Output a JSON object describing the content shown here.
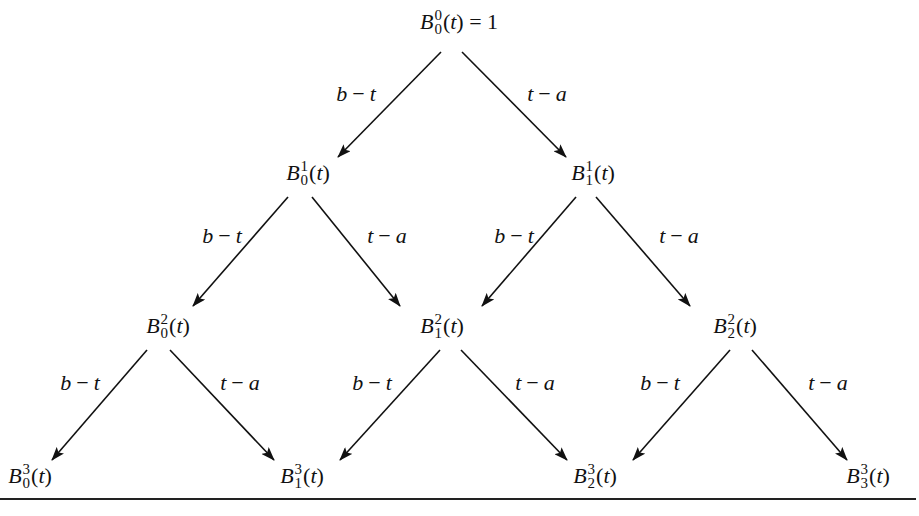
{
  "diagram": {
    "edge_labels": {
      "left": "b − t",
      "right": "t − a"
    },
    "nodes": [
      {
        "id": "B00",
        "base": "B",
        "sup": "0",
        "sub": "0",
        "arg": "(t)",
        "tail": " = 1",
        "x": 459,
        "y": 22
      },
      {
        "id": "B10",
        "base": "B",
        "sup": "1",
        "sub": "0",
        "arg": "(t)",
        "tail": "",
        "x": 308,
        "y": 173
      },
      {
        "id": "B11",
        "base": "B",
        "sup": "1",
        "sub": "1",
        "arg": "(t)",
        "tail": "",
        "x": 593,
        "y": 173
      },
      {
        "id": "B20",
        "base": "B",
        "sup": "2",
        "sub": "0",
        "arg": "(t)",
        "tail": "",
        "x": 168,
        "y": 326
      },
      {
        "id": "B21",
        "base": "B",
        "sup": "2",
        "sub": "1",
        "arg": "(t)",
        "tail": "",
        "x": 442,
        "y": 326
      },
      {
        "id": "B22",
        "base": "B",
        "sup": "2",
        "sub": "2",
        "arg": "(t)",
        "tail": "",
        "x": 735,
        "y": 326
      },
      {
        "id": "B30",
        "base": "B",
        "sup": "3",
        "sub": "0",
        "arg": "(t)",
        "tail": "",
        "x": 30,
        "y": 476
      },
      {
        "id": "B31",
        "base": "B",
        "sup": "3",
        "sub": "1",
        "arg": "(t)",
        "tail": "",
        "x": 302,
        "y": 476
      },
      {
        "id": "B32",
        "base": "B",
        "sup": "3",
        "sub": "2",
        "arg": "(t)",
        "tail": "",
        "x": 595,
        "y": 476
      },
      {
        "id": "B33",
        "base": "B",
        "sup": "3",
        "sub": "3",
        "arg": "(t)",
        "tail": "",
        "x": 868,
        "y": 476
      }
    ],
    "edges": [
      {
        "from": "B00",
        "to": "B10",
        "label": "b − t",
        "x1": 441,
        "y1": 52,
        "x2": 338,
        "y2": 157,
        "lx": 356,
        "ly": 94
      },
      {
        "from": "B00",
        "to": "B11",
        "label": "t − a",
        "x1": 462,
        "y1": 52,
        "x2": 566,
        "y2": 157,
        "lx": 547,
        "ly": 94
      },
      {
        "from": "B10",
        "to": "B20",
        "label": "b − t",
        "x1": 288,
        "y1": 197,
        "x2": 193,
        "y2": 306,
        "lx": 222,
        "ly": 236
      },
      {
        "from": "B10",
        "to": "B21",
        "label": "t − a",
        "x1": 312,
        "y1": 197,
        "x2": 400,
        "y2": 306,
        "lx": 387,
        "ly": 236
      },
      {
        "from": "B11",
        "to": "B21",
        "label": "b − t",
        "x1": 576,
        "y1": 197,
        "x2": 482,
        "y2": 306,
        "lx": 514,
        "ly": 236
      },
      {
        "from": "B11",
        "to": "B22",
        "label": "t − a",
        "x1": 596,
        "y1": 197,
        "x2": 690,
        "y2": 306,
        "lx": 679,
        "ly": 236
      },
      {
        "from": "B20",
        "to": "B30",
        "label": "b − t",
        "x1": 147,
        "y1": 350,
        "x2": 52,
        "y2": 460,
        "lx": 80,
        "ly": 383
      },
      {
        "from": "B20",
        "to": "B31",
        "label": "t − a",
        "x1": 170,
        "y1": 350,
        "x2": 274,
        "y2": 460,
        "lx": 240,
        "ly": 383
      },
      {
        "from": "B21",
        "to": "B31",
        "label": "b − t",
        "x1": 440,
        "y1": 350,
        "x2": 340,
        "y2": 460,
        "lx": 372,
        "ly": 383
      },
      {
        "from": "B21",
        "to": "B32",
        "label": "t − a",
        "x1": 461,
        "y1": 350,
        "x2": 567,
        "y2": 460,
        "lx": 535,
        "ly": 383
      },
      {
        "from": "B22",
        "to": "B32",
        "label": "b − t",
        "x1": 730,
        "y1": 350,
        "x2": 633,
        "y2": 460,
        "lx": 660,
        "ly": 383
      },
      {
        "from": "B22",
        "to": "B33",
        "label": "t − a",
        "x1": 752,
        "y1": 350,
        "x2": 847,
        "y2": 460,
        "lx": 828,
        "ly": 383
      }
    ]
  }
}
